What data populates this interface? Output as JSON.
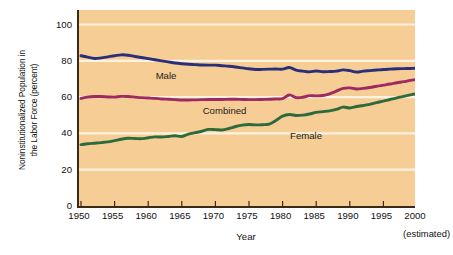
{
  "chart_data": {
    "type": "line",
    "title": "",
    "xlabel": "Year",
    "ylabel_line1": "Noninstitutionalized Population in",
    "ylabel_line2": "the Labor Force (percent)",
    "note": "(estimated)",
    "xlim": [
      1950,
      2000
    ],
    "ylim": [
      0,
      108
    ],
    "yticks": [
      0,
      20,
      40,
      60,
      80,
      100
    ],
    "ytick_labels": [
      "0",
      "20",
      "40",
      "60",
      "80",
      "100"
    ],
    "gridlines": [
      20,
      40,
      60,
      80,
      100
    ],
    "grid": true,
    "grid_color": "#fbf3e2",
    "plot_background": "#f6cd95",
    "axis_color": "#3b2a18",
    "legend": "inline-labels",
    "xticks": [
      1950,
      1955,
      1960,
      1965,
      1970,
      1975,
      1980,
      1985,
      1990,
      1995,
      2000
    ],
    "xtick_labels": [
      "1950",
      "1955",
      "1960",
      "1965",
      "1970",
      "1975",
      "1980",
      "1985",
      "1990",
      "1995",
      "2000"
    ],
    "x": [
      1950,
      1951,
      1952,
      1953,
      1954,
      1955,
      1956,
      1957,
      1958,
      1959,
      1960,
      1961,
      1962,
      1963,
      1964,
      1965,
      1966,
      1967,
      1968,
      1969,
      1970,
      1971,
      1972,
      1973,
      1974,
      1975,
      1976,
      1977,
      1978,
      1979,
      1980,
      1981,
      1982,
      1983,
      1984,
      1985,
      1986,
      1987,
      1988,
      1989,
      1990,
      1991,
      1992,
      1993,
      1994,
      1995,
      1996,
      1997,
      1998,
      1999,
      2000
    ],
    "series": [
      {
        "name": "Male",
        "color": "#2b2f78",
        "label": "Male",
        "values": [
          82.8,
          82.0,
          81.3,
          81.6,
          82.2,
          82.8,
          83.3,
          83.1,
          82.4,
          81.8,
          81.2,
          80.6,
          80.0,
          79.4,
          78.8,
          78.4,
          78.1,
          77.9,
          77.7,
          77.6,
          77.6,
          77.3,
          77.0,
          76.6,
          76.1,
          75.6,
          75.2,
          75.3,
          75.4,
          75.5,
          75.4,
          76.3,
          74.9,
          74.3,
          73.9,
          74.4,
          74.0,
          74.1,
          74.3,
          75.0,
          74.6,
          73.8,
          74.3,
          74.6,
          74.9,
          75.2,
          75.4,
          75.6,
          75.7,
          75.8,
          75.9
        ],
        "endpoints": {
          "1950": 82.8,
          "1956": 83.3,
          "1975": 75.6,
          "1983": 74.3,
          "2000": 75.9
        }
      },
      {
        "name": "Combined",
        "color": "#9d2a60",
        "label": "Combined",
        "values": [
          59.3,
          60.0,
          60.3,
          60.3,
          60.1,
          60.0,
          60.4,
          60.3,
          60.0,
          59.7,
          59.5,
          59.3,
          59.0,
          58.8,
          58.6,
          58.4,
          58.4,
          58.5,
          58.6,
          58.7,
          58.7,
          58.7,
          58.8,
          58.8,
          58.7,
          58.6,
          58.6,
          58.7,
          58.8,
          59.0,
          59.2,
          61.2,
          59.7,
          59.9,
          60.8,
          60.7,
          60.9,
          61.8,
          63.3,
          64.8,
          65.1,
          64.5,
          64.8,
          65.3,
          66.0,
          66.6,
          67.2,
          67.9,
          68.5,
          69.2,
          69.8
        ],
        "endpoints": {
          "1950": 59.3,
          "1965": 58.4,
          "1981": 61.2,
          "1989": 64.8,
          "2000": 69.8
        }
      },
      {
        "name": "Female",
        "color": "#2e6b3c",
        "label": "Female",
        "values": [
          33.8,
          34.3,
          34.6,
          34.9,
          35.3,
          36.0,
          36.8,
          37.3,
          37.2,
          37.1,
          37.6,
          38.1,
          38.0,
          38.3,
          38.7,
          38.3,
          39.6,
          40.4,
          41.2,
          42.2,
          42.1,
          41.9,
          42.7,
          43.8,
          44.6,
          44.9,
          44.7,
          44.8,
          45.1,
          47.1,
          49.5,
          50.4,
          49.9,
          50.1,
          50.7,
          51.6,
          52.0,
          52.4,
          53.2,
          54.5,
          54.0,
          54.8,
          55.4,
          56.0,
          57.0,
          57.8,
          58.7,
          59.6,
          60.4,
          61.2,
          62.0
        ],
        "endpoints": {
          "1950": 33.8,
          "1970": 42.1,
          "1980": 49.5,
          "1990": 54.0,
          "2000": 62.0
        }
      }
    ]
  }
}
